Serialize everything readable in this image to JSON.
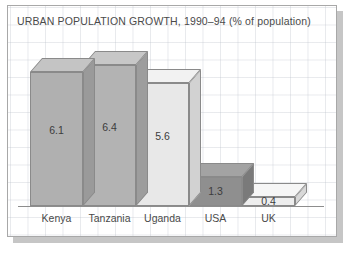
{
  "chart_data": {
    "type": "bar",
    "title": "URBAN POPULATION GROWTH, 1990–94 (% of population)",
    "xlabel": "",
    "ylabel": "",
    "ylim": [
      0,
      7
    ],
    "grid": true,
    "legend": "none",
    "style": "3d-bar",
    "categories": [
      "Kenya",
      "Tanzania",
      "Uganda",
      "USA",
      "UK"
    ],
    "values": [
      6.1,
      6.4,
      5.6,
      1.3,
      0.4
    ],
    "value_labels": [
      "6.1",
      "6.4",
      "5.6",
      "1.3",
      "0.4"
    ],
    "bar_colors": [
      "#b0b0b0",
      "#b3b3b3",
      "#e8e8e8",
      "#8f8f8f",
      "#eeeeee"
    ],
    "bar_top_colors": [
      "#c4c4c4",
      "#c7c7c7",
      "#f2f2f2",
      "#a3a3a3",
      "#f6f6f6"
    ],
    "bar_side_colors": [
      "#9a9a9a",
      "#9d9d9d",
      "#d2d2d2",
      "#7a7a7a",
      "#d8d8d8"
    ]
  },
  "frame": {
    "border_color": "#a8a8a8",
    "shadow_color": "#c6c6c6",
    "background": "#ffffff",
    "grid_color": "#b4bac4"
  }
}
